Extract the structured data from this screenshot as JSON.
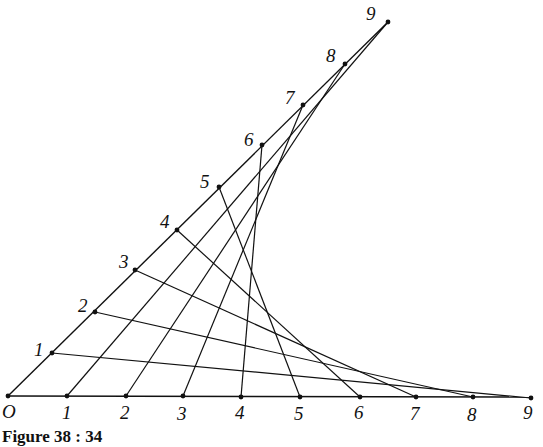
{
  "caption": "Figure 38 : 34",
  "origin": {
    "label": "O",
    "x": 8,
    "y": 396,
    "label_x": 2,
    "label_y": 418
  },
  "diagonal_end": {
    "x": 388,
    "y": 22
  },
  "axis_end": {
    "x": 531,
    "y": 397
  },
  "diagonal_points": [
    {
      "label": "1",
      "x": 52,
      "y": 353,
      "lx": 34,
      "ly": 356
    },
    {
      "label": "2",
      "x": 95,
      "y": 312,
      "lx": 78,
      "ly": 312
    },
    {
      "label": "3",
      "x": 135,
      "y": 270,
      "lx": 119,
      "ly": 268
    },
    {
      "label": "4",
      "x": 177,
      "y": 230,
      "lx": 160,
      "ly": 228
    },
    {
      "label": "5",
      "x": 219,
      "y": 187,
      "lx": 200,
      "ly": 188
    },
    {
      "label": "6",
      "x": 262,
      "y": 145,
      "lx": 244,
      "ly": 146
    },
    {
      "label": "7",
      "x": 303,
      "y": 105,
      "lx": 285,
      "ly": 104
    },
    {
      "label": "8",
      "x": 345,
      "y": 64,
      "lx": 326,
      "ly": 62
    },
    {
      "label": "9",
      "x": 388,
      "y": 22,
      "lx": 366,
      "ly": 20
    }
  ],
  "axis_points": [
    {
      "label": "1",
      "x": 67,
      "y": 396,
      "lx": 62,
      "ly": 419
    },
    {
      "label": "2",
      "x": 126,
      "y": 396,
      "lx": 120,
      "ly": 419
    },
    {
      "label": "3",
      "x": 183,
      "y": 396,
      "lx": 177,
      "ly": 420
    },
    {
      "label": "4",
      "x": 241,
      "y": 397,
      "lx": 235,
      "ly": 419
    },
    {
      "label": "5",
      "x": 300,
      "y": 397,
      "lx": 294,
      "ly": 420
    },
    {
      "label": "6",
      "x": 360,
      "y": 397,
      "lx": 354,
      "ly": 419
    },
    {
      "label": "7",
      "x": 416,
      "y": 397,
      "lx": 410,
      "ly": 420
    },
    {
      "label": "8",
      "x": 473,
      "y": 397,
      "lx": 467,
      "ly": 421
    },
    {
      "label": "9",
      "x": 531,
      "y": 398,
      "lx": 523,
      "ly": 419
    }
  ],
  "connections_rule": "diagonal point k joined to axis point (10 - k)",
  "colors": {
    "ink": "#111111",
    "background": "#ffffff"
  }
}
